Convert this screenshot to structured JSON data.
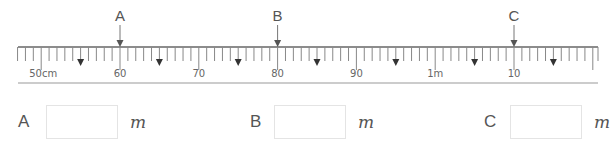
{
  "ruler": {
    "start_cm": 47,
    "end_cm": 120,
    "origin_x": 18,
    "end_x": 598,
    "px_per_cm": 7.88,
    "zero_cm_x": 120,
    "zero_cm": 60,
    "line_y": 47,
    "bottom_line_y": 83,
    "major_labels": [
      {
        "cm": 50,
        "text": "50cm"
      },
      {
        "cm": 60,
        "text": "60"
      },
      {
        "cm": 70,
        "text": "70"
      },
      {
        "cm": 80,
        "text": "80"
      },
      {
        "cm": 90,
        "text": "90"
      },
      {
        "cm": 100,
        "text": "1m"
      },
      {
        "cm": 110,
        "text": "10"
      }
    ],
    "half_marks_cm": [
      55,
      65,
      75,
      85,
      95,
      105,
      115
    ],
    "pointers": [
      {
        "label": "A",
        "cm": 60
      },
      {
        "label": "B",
        "cm": 80
      },
      {
        "label": "C",
        "cm": 110
      }
    ],
    "line_color": "#666666",
    "tick_color": "#888888"
  },
  "answers": [
    {
      "label": "A",
      "unit": "m",
      "value": "",
      "x": 18
    },
    {
      "label": "B",
      "unit": "m",
      "value": "",
      "x": 250
    },
    {
      "label": "C",
      "unit": "m",
      "value": "",
      "x": 485
    }
  ]
}
